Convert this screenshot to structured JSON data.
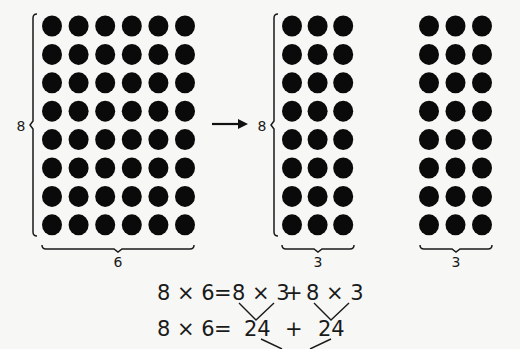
{
  "figure": {
    "colors": {
      "dot": "#0a0a0a",
      "ink": "#1a1a1a",
      "background": "#f7f7f5"
    },
    "arrays": [
      {
        "id": "full",
        "rows": 8,
        "cols": 6,
        "row_label": "8",
        "col_label": "6",
        "x0": 52,
        "y0": 26,
        "dx": 26.6,
        "dy": 28.4,
        "r": 10,
        "has_row_brace": true,
        "row_brace_x": 33,
        "row_label_x": 20,
        "col_brace_y": 249
      },
      {
        "id": "left-part",
        "rows": 8,
        "cols": 3,
        "row_label": "8",
        "col_label": "3",
        "x0": 292,
        "y0": 26,
        "dx": 25.6,
        "dy": 28.4,
        "r": 10,
        "has_row_brace": true,
        "row_brace_x": 274,
        "row_label_x": 262,
        "col_brace_y": 249
      },
      {
        "id": "right-part",
        "rows": 8,
        "cols": 3,
        "row_label": "",
        "col_label": "3",
        "x0": 429,
        "y0": 26,
        "dx": 26.5,
        "dy": 28.4,
        "r": 10,
        "has_row_brace": false,
        "col_brace_y": 249
      }
    ],
    "arrow": {
      "x1": 212,
      "x2": 248,
      "y": 124
    },
    "labels": {
      "full_rows": "8",
      "full_cols": "6",
      "left_rows": "8",
      "left_cols": "3",
      "right_cols": "3"
    },
    "equations": {
      "line1": "8 × 6 = 8 × 3 + 8 × 3",
      "line1_parts": {
        "lhs": "8 × 6",
        "eq": "=",
        "term1": "8 × 3",
        "plus": "+",
        "term2": "8 × 3"
      },
      "line2_parts": {
        "lhs": "8 × 6",
        "eq": "=",
        "term1": "24",
        "plus": "+",
        "term2": "24"
      }
    }
  }
}
